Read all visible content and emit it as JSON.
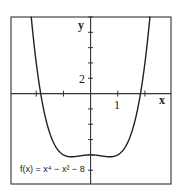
{
  "chart_data": {
    "type": "line",
    "title": "",
    "function": "f(x) = x^4 - x^2 - 8",
    "annotation": "f(x) = x⁴ − x² − 8",
    "xlabel": "x",
    "ylabel": "y",
    "xlim": [
      -2.93,
      2.96
    ],
    "ylim": [
      -11.8,
      10
    ],
    "x_tick_step": 1,
    "y_tick_step": 2,
    "x_tick_labels": [
      {
        "value": 1,
        "label": "1"
      }
    ],
    "y_tick_labels": [
      {
        "value": 2,
        "label": "2"
      }
    ],
    "grid": false,
    "legend": null,
    "series": [
      {
        "name": "f(x) = x⁴ − x² − 8",
        "x": [
          -2.2,
          -2.0,
          -1.8,
          -1.6,
          -1.4,
          -1.2,
          -1.0,
          -0.8,
          -0.707,
          -0.6,
          -0.4,
          -0.2,
          0,
          0.2,
          0.4,
          0.6,
          0.707,
          0.8,
          1.0,
          1.2,
          1.4,
          1.6,
          1.8,
          2.0,
          2.2
        ],
        "y": [
          10.58,
          4.0,
          -0.74,
          -4.0,
          -6.12,
          -7.37,
          -8.0,
          -8.23,
          -8.25,
          -8.23,
          -8.13,
          -8.04,
          -8.0,
          -8.04,
          -8.13,
          -8.23,
          -8.25,
          -8.23,
          -8.0,
          -7.37,
          -6.12,
          -4.0,
          -0.74,
          4.0,
          10.58
        ]
      }
    ],
    "colors": {
      "curve": "#222222",
      "axes": "#333333",
      "frame": "#444444"
    }
  }
}
